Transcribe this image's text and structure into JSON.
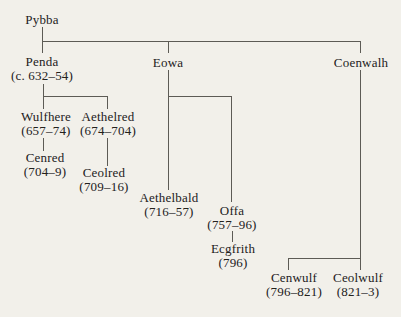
{
  "figure": {
    "type": "genealogical-family-tree"
  },
  "palette": {
    "background": "#f2f0ea",
    "line": "#5d5b55",
    "text": "#23211c"
  },
  "people": [
    {
      "name": "Pybba",
      "dates": ""
    },
    {
      "name": "Penda",
      "dates": "(c. 632–54)"
    },
    {
      "name": "Eowa",
      "dates": ""
    },
    {
      "name": "Coenwalh",
      "dates": ""
    },
    {
      "name": "Wulfhere",
      "dates": "(657–74)"
    },
    {
      "name": "Aethelred",
      "dates": "(674–704)"
    },
    {
      "name": "Cenred",
      "dates": "(704–9)"
    },
    {
      "name": "Ceolred",
      "dates": "(709–16)"
    },
    {
      "name": "Aethelbald",
      "dates": "(716–57)"
    },
    {
      "name": "Offa",
      "dates": "(757–96)"
    },
    {
      "name": "Ecgfrith",
      "dates": "(796)"
    },
    {
      "name": "Cenwulf",
      "dates": "(796–821)"
    },
    {
      "name": "Ceolwulf",
      "dates": "(821–3)"
    }
  ],
  "relations": [
    {
      "parent": "Pybba",
      "children": [
        "Penda",
        "Eowa",
        "Coenwalh"
      ]
    },
    {
      "parent": "Penda",
      "children": [
        "Wulfhere",
        "Aethelred"
      ]
    },
    {
      "parent": "Wulfhere",
      "children": [
        "Cenred"
      ]
    },
    {
      "parent": "Aethelred",
      "children": [
        "Ceolred"
      ]
    },
    {
      "parent": "Eowa",
      "children": [
        "Aethelbald",
        "Offa"
      ]
    },
    {
      "parent": "Offa",
      "children": [
        "Ecgfrith"
      ]
    },
    {
      "parent": "Coenwalh",
      "children": [
        "Cenwulf",
        "Ceolwulf"
      ]
    }
  ]
}
